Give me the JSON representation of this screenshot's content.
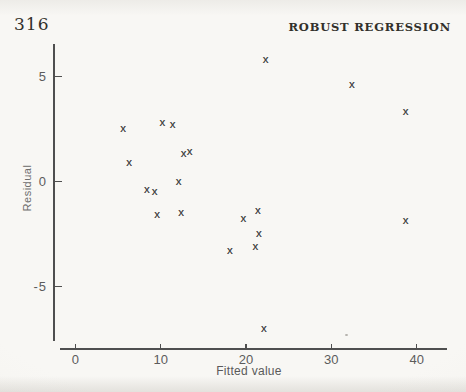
{
  "page": {
    "page_number": "316",
    "running_header": "ROBUST REGRESSION"
  },
  "chart_data": {
    "type": "scatter",
    "title": "",
    "xlabel": "Fitted value",
    "ylabel": "Residual",
    "marker_glyph": "x",
    "grid": false,
    "legend": false,
    "xlim": [
      -1.8,
      43.5
    ],
    "ylim": [
      -7.6,
      6.5
    ],
    "x_ticks": {
      "values": [
        0,
        10,
        20,
        30,
        40
      ],
      "labels": [
        "0",
        "10",
        "20",
        "30",
        "40"
      ]
    },
    "y_ticks": {
      "values": [
        5,
        0,
        -5
      ],
      "labels": [
        "5",
        "0",
        "-5"
      ]
    },
    "points": [
      {
        "x": 5.6,
        "y": 2.5
      },
      {
        "x": 6.3,
        "y": 0.9
      },
      {
        "x": 8.4,
        "y": -0.4
      },
      {
        "x": 9.3,
        "y": -0.5
      },
      {
        "x": 9.6,
        "y": -1.6
      },
      {
        "x": 10.2,
        "y": 2.8
      },
      {
        "x": 11.4,
        "y": 2.7
      },
      {
        "x": 12.1,
        "y": 0.0
      },
      {
        "x": 12.4,
        "y": -1.5
      },
      {
        "x": 12.7,
        "y": 1.3
      },
      {
        "x": 13.4,
        "y": 1.4
      },
      {
        "x": 18.1,
        "y": -3.3
      },
      {
        "x": 19.7,
        "y": -1.8
      },
      {
        "x": 21.1,
        "y": -3.1
      },
      {
        "x": 21.4,
        "y": -1.4
      },
      {
        "x": 21.5,
        "y": -2.5
      },
      {
        "x": 22.1,
        "y": -7.0
      },
      {
        "x": 22.3,
        "y": 5.8
      },
      {
        "x": 32.4,
        "y": 4.6
      },
      {
        "x": 38.7,
        "y": 3.3
      },
      {
        "x": 38.7,
        "y": -1.9
      }
    ]
  },
  "colors": {
    "paper": "#f7f6f3",
    "axis": "#4f4f4f",
    "marker": "#474747",
    "tick_text": "#5c5c5c",
    "header_text": "#32302b"
  }
}
